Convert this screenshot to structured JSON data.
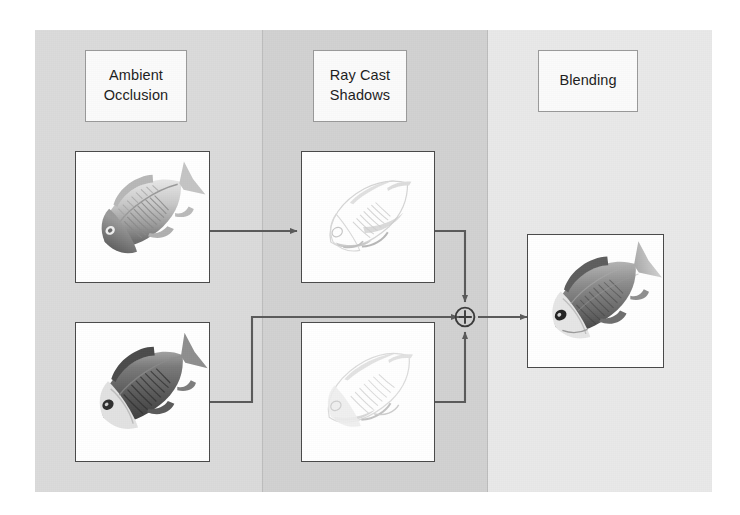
{
  "diagram": {
    "kind": "pipeline-flow-diagram",
    "title_visible": false,
    "background_color": "#d9d9d9",
    "panels": [
      {
        "id": "ambient-occlusion",
        "label": "Ambient\nOcclusion",
        "label_line1": "Ambient",
        "label_line2": "Occlusion",
        "fill": "#dbdbdb"
      },
      {
        "id": "ray-cast-shadows",
        "label": "Ray Cast\nShadows",
        "label_line1": "Ray Cast",
        "label_line2": "Shadows",
        "fill": "#d2d2d2"
      },
      {
        "id": "blending",
        "label": "Blending",
        "label_line1": "Blending",
        "label_line2": "",
        "fill": "#e9e9e9"
      }
    ],
    "operator": {
      "symbol": "⊕",
      "name": "circled-plus",
      "meaning": "blend-combine"
    },
    "thumbnails": [
      {
        "id": "ao-top",
        "column": "ambient-occlusion",
        "caption": "",
        "subject": "fish",
        "style": "ambient-occlusion pass, light grey shading"
      },
      {
        "id": "ao-bottom",
        "column": "ambient-occlusion",
        "caption": "",
        "subject": "fish",
        "style": "ambient-occlusion pass, dark shading"
      },
      {
        "id": "rcs-top",
        "column": "ray-cast-shadows",
        "caption": "",
        "subject": "fish",
        "style": "ray cast shadow pass, very light"
      },
      {
        "id": "rcs-bottom",
        "column": "ray-cast-shadows",
        "caption": "",
        "subject": "fish",
        "style": "ray cast shadow pass, very light"
      },
      {
        "id": "blend-out",
        "column": "blending",
        "caption": "",
        "subject": "fish",
        "style": "final blended render"
      }
    ],
    "connections": [
      {
        "from": "ao-top",
        "to": "rcs-top",
        "type": "arrow"
      },
      {
        "from": "ao-bottom",
        "to": "operator",
        "type": "arrow-routed"
      },
      {
        "from": "rcs-top",
        "to": "operator",
        "type": "arrow-routed"
      },
      {
        "from": "rcs-bottom",
        "to": "operator",
        "type": "arrow-routed"
      },
      {
        "from": "operator",
        "to": "blend-out",
        "type": "arrow"
      }
    ],
    "colors": {
      "frame_border": "#4a4a4a",
      "label_border": "#9a9a9a",
      "label_fill": "#fbfbfb",
      "wire": "#5a5a5a",
      "text": "#1d1d1d"
    }
  }
}
